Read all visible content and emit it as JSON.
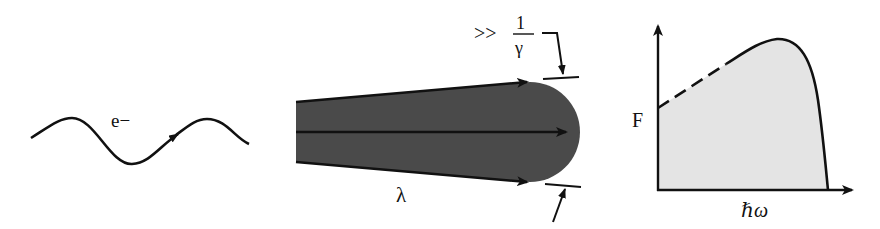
{
  "figure": {
    "panels": [
      {
        "id": "electron-trajectory",
        "label": "e−"
      },
      {
        "id": "radiation-cone",
        "wavelength_label": "λ",
        "angle_relation": ">>",
        "angle_numerator": "1",
        "angle_denominator": "γ"
      },
      {
        "id": "spectrum",
        "y_label": "F",
        "x_label": "ℏω"
      }
    ],
    "colors": {
      "stroke": "#111111",
      "beam_fill": "#4a4a4a",
      "spectrum_fill": "#e4e4e4",
      "background": "#ffffff"
    }
  }
}
